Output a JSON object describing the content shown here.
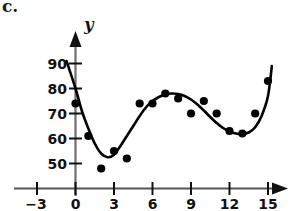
{
  "figure": {
    "part_label": "c.",
    "y_axis_name": "y",
    "x_axis_name": ""
  },
  "chart_data": {
    "type": "scatter",
    "title": "",
    "subtitle": "",
    "xlabel": "",
    "ylabel": "y",
    "xlim": [
      -3.6,
      16.6
    ],
    "ylim": [
      42,
      96
    ],
    "grid": false,
    "legend": "none",
    "x_ticks": [
      -3,
      0,
      3,
      6,
      9,
      12,
      15
    ],
    "x_tick_labels": [
      "−3",
      "0",
      "3",
      "6",
      "9",
      "12",
      "15"
    ],
    "y_ticks": [
      50,
      60,
      70,
      80,
      90
    ],
    "y_tick_labels": [
      "50",
      "60",
      "70",
      "80",
      "90"
    ],
    "series": [
      {
        "name": "data points",
        "type": "scatter",
        "marker": "filled-circle",
        "color": "#000000",
        "x": [
          0,
          1,
          2,
          3,
          4,
          5,
          6,
          7,
          8,
          9,
          10,
          11,
          12,
          13,
          14,
          15
        ],
        "y": [
          74,
          61,
          48,
          55,
          52,
          74,
          74,
          78,
          76,
          70,
          75,
          70,
          63,
          62,
          70,
          83
        ]
      },
      {
        "name": "fitted curve",
        "type": "line",
        "color": "#000000",
        "x": [
          -0.7,
          0,
          0.5,
          1,
          1.5,
          2,
          2.5,
          3,
          3.5,
          4,
          4.5,
          5,
          5.5,
          6,
          6.5,
          7,
          7.5,
          8,
          8.5,
          9,
          9.5,
          10,
          10.5,
          11,
          11.5,
          12,
          12.5,
          13,
          13.5,
          14,
          14.5,
          15,
          15.3
        ],
        "y": [
          91,
          80,
          71,
          64,
          58,
          54,
          52.5,
          53.5,
          57,
          61,
          65,
          69,
          72.5,
          75,
          76.6,
          77.6,
          78,
          77.8,
          77,
          75.6,
          73.6,
          71.2,
          68.6,
          66.2,
          64.2,
          62.8,
          62,
          61.8,
          62.4,
          64.5,
          69,
          77,
          89
        ]
      }
    ],
    "axis_arrows": {
      "x_axis": "right-arrow",
      "y_axis": "up-arrow"
    }
  }
}
